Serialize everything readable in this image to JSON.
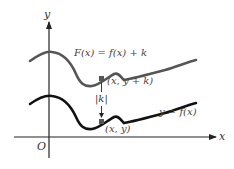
{
  "figure": {
    "x_axis_label": "x",
    "y_axis_label": "y",
    "origin_label": "O",
    "upper_curve_label": "F(x) = f(x) + k",
    "lower_curve_label": "y = f(x)",
    "upper_point_label": "(x, y + k)",
    "lower_point_label": "(x, y)",
    "shift_label": "|k|",
    "colors": {
      "upper_curve": "#555555",
      "lower_curve": "#111111",
      "axes": "#222222",
      "points": "#555555"
    }
  }
}
